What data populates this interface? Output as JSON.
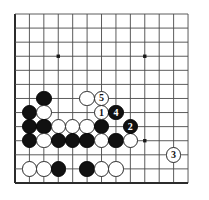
{
  "diagram": {
    "kind": "go-board-diagram",
    "board": {
      "columns": 13,
      "rows": 13,
      "line_color": "#4a4a4a",
      "edge_color": "#2b2b2b",
      "background_color": "#ffffff",
      "star_point_color": "#1a1a1a",
      "left_px": 15,
      "top_px": 14,
      "spacing_x_px": 14.42,
      "spacing_y_px": 14.08,
      "stone_diameter_px": 15.5,
      "star_points": [
        {
          "col": 3,
          "row": 3
        },
        {
          "col": 9,
          "row": 3
        },
        {
          "col": 9,
          "row": 9
        }
      ]
    },
    "colors": {
      "black_stone": "#111111",
      "white_stone": "#ffffff",
      "white_stone_border": "#2a2a2a",
      "black_label_text": "#ffffff",
      "white_label_text": "#111111"
    },
    "move_sequence": [
      {
        "number": "1",
        "color": "white",
        "col": 6,
        "row": 7
      },
      {
        "number": "2",
        "color": "black",
        "col": 8,
        "row": 8
      },
      {
        "number": "3",
        "color": "white",
        "col": 11,
        "row": 10
      },
      {
        "number": "4",
        "color": "black",
        "col": 7,
        "row": 7
      },
      {
        "number": "5",
        "color": "white",
        "col": 6,
        "row": 6
      }
    ],
    "stones": [
      {
        "color": "black",
        "col": 2,
        "row": 6,
        "label": ""
      },
      {
        "color": "white",
        "col": 5,
        "row": 6,
        "label": ""
      },
      {
        "color": "white",
        "col": 6,
        "row": 6,
        "label": "5"
      },
      {
        "color": "black",
        "col": 1,
        "row": 7,
        "label": ""
      },
      {
        "color": "white",
        "col": 2,
        "row": 7,
        "label": ""
      },
      {
        "color": "white",
        "col": 6,
        "row": 7,
        "label": "1"
      },
      {
        "color": "black",
        "col": 7,
        "row": 7,
        "label": "4"
      },
      {
        "color": "black",
        "col": 1,
        "row": 8,
        "label": ""
      },
      {
        "color": "black",
        "col": 2,
        "row": 8,
        "label": ""
      },
      {
        "color": "white",
        "col": 3,
        "row": 8,
        "label": ""
      },
      {
        "color": "white",
        "col": 4,
        "row": 8,
        "label": ""
      },
      {
        "color": "white",
        "col": 5,
        "row": 8,
        "label": ""
      },
      {
        "color": "black",
        "col": 6,
        "row": 8,
        "label": ""
      },
      {
        "color": "black",
        "col": 8,
        "row": 8,
        "label": "2"
      },
      {
        "color": "black",
        "col": 1,
        "row": 9,
        "label": ""
      },
      {
        "color": "white",
        "col": 2,
        "row": 9,
        "label": ""
      },
      {
        "color": "black",
        "col": 3,
        "row": 9,
        "label": ""
      },
      {
        "color": "black",
        "col": 4,
        "row": 9,
        "label": ""
      },
      {
        "color": "black",
        "col": 5,
        "row": 9,
        "label": ""
      },
      {
        "color": "white",
        "col": 6,
        "row": 9,
        "label": ""
      },
      {
        "color": "black",
        "col": 7,
        "row": 9,
        "label": ""
      },
      {
        "color": "white",
        "col": 8,
        "row": 9,
        "label": ""
      },
      {
        "color": "white",
        "col": 11,
        "row": 10,
        "label": "3"
      },
      {
        "color": "white",
        "col": 1,
        "row": 11,
        "label": ""
      },
      {
        "color": "white",
        "col": 2,
        "row": 11,
        "label": ""
      },
      {
        "color": "black",
        "col": 3,
        "row": 11,
        "label": ""
      },
      {
        "color": "black",
        "col": 5,
        "row": 11,
        "label": ""
      },
      {
        "color": "white",
        "col": 6,
        "row": 11,
        "label": ""
      },
      {
        "color": "white",
        "col": 7,
        "row": 11,
        "label": ""
      }
    ]
  }
}
